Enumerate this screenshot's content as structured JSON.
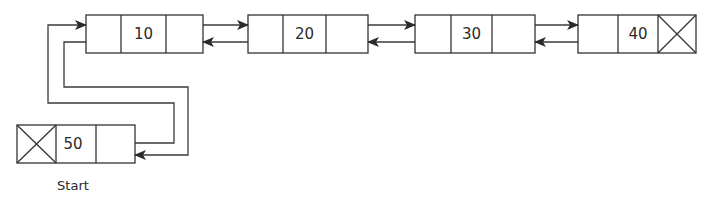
{
  "diagram": {
    "type": "doubly-circular-linked-list",
    "nodes": [
      {
        "id": "n10",
        "value": "10",
        "prev_null": false,
        "next_null": false
      },
      {
        "id": "n20",
        "value": "20",
        "prev_null": false,
        "next_null": false
      },
      {
        "id": "n30",
        "value": "30",
        "prev_null": false,
        "next_null": false
      },
      {
        "id": "n40",
        "value": "40",
        "prev_null": false,
        "next_null": true
      },
      {
        "id": "n50",
        "value": "50",
        "prev_null": true,
        "next_null": false
      }
    ],
    "start_label": "Start",
    "colors": {
      "stroke": "#333333",
      "text": "#2a2a2a",
      "background": "#ffffff"
    }
  }
}
